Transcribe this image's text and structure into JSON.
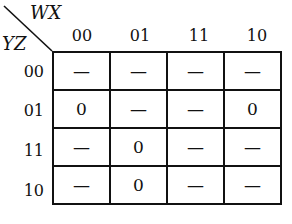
{
  "kmap": {
    "col_var": "WX",
    "row_var": "YZ",
    "col_headers": [
      "00",
      "01",
      "11",
      "10"
    ],
    "row_headers": [
      "00",
      "01",
      "11",
      "10"
    ],
    "cells": [
      [
        "—",
        "—",
        "—",
        "—"
      ],
      [
        "0",
        "—",
        "—",
        "0"
      ],
      [
        "—",
        "0",
        "—",
        "—"
      ],
      [
        "—",
        "0",
        "—",
        "—"
      ]
    ]
  }
}
